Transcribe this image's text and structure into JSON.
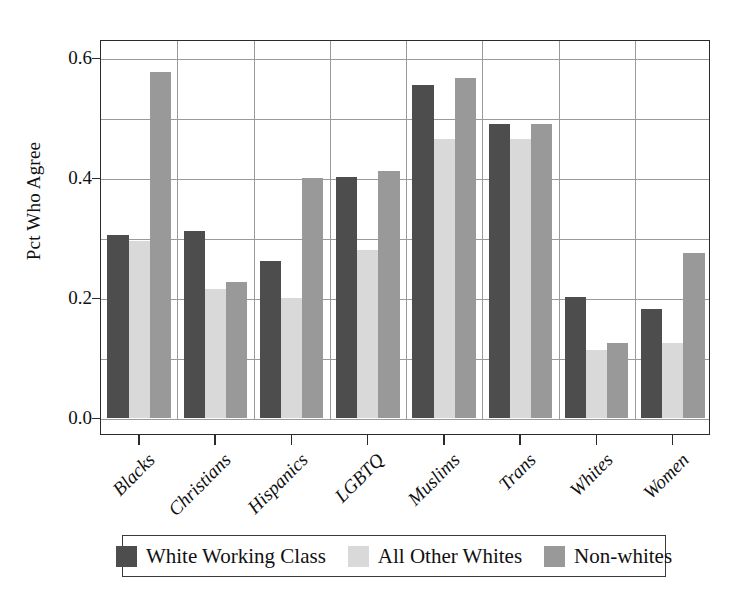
{
  "chart_data": {
    "type": "bar",
    "title": "",
    "subtitle": "",
    "xlabel": "",
    "ylabel": "Pct Who Agree",
    "ylim": [
      0.0,
      0.63
    ],
    "yticks": [
      "0.0",
      "0.2",
      "0.4",
      "0.6"
    ],
    "ytick_values": [
      0.0,
      0.2,
      0.4,
      0.6
    ],
    "gridlines": [
      0.0,
      0.1,
      0.2,
      0.3,
      0.4,
      0.5,
      0.6
    ],
    "grid": true,
    "legend_position": "bottom",
    "categories": [
      "Blacks",
      "Christians",
      "Hispanics",
      "LGBTQ",
      "Muslims",
      "Trans",
      "Whites",
      "Women"
    ],
    "series": [
      {
        "name": "White Working Class",
        "color": "#4d4d4d",
        "values": [
          0.305,
          0.312,
          0.262,
          0.402,
          0.556,
          0.49,
          0.202,
          0.182
        ]
      },
      {
        "name": "All Other Whites",
        "color": "#d9d9d9",
        "values": [
          0.295,
          0.215,
          0.2,
          0.281,
          0.466,
          0.466,
          0.114,
          0.126
        ]
      },
      {
        "name": "Non-whites",
        "color": "#999999",
        "values": [
          0.578,
          0.228,
          0.4,
          0.412,
          0.568,
          0.49,
          0.126,
          0.276
        ]
      }
    ]
  },
  "axes": {
    "ylabel": "Pct Who Agree"
  },
  "legend": {
    "entries": [
      {
        "label": "White Working Class",
        "color": "#4d4d4d"
      },
      {
        "label": "All Other Whites",
        "color": "#d9d9d9"
      },
      {
        "label": "Non-whites",
        "color": "#999999"
      }
    ]
  }
}
